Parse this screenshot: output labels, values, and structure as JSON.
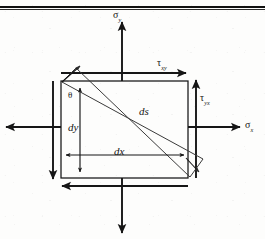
{
  "figure": {
    "kind": "stress-element-diagram",
    "running_head": "",
    "colors": {
      "ink": "#161616",
      "rule": "#111111",
      "paper": "#fdfdfc",
      "diagonal": "#3a3a3a"
    },
    "element": {
      "left": 61,
      "top": 81,
      "right": 188,
      "bottom": 178
    }
  },
  "labels": {
    "sigma_y_top": {
      "base": "σ",
      "sub": "y",
      "x": 113,
      "y": 10
    },
    "sigma_x_right": {
      "base": "σ",
      "sub": "x",
      "x": 245,
      "y": 120
    },
    "tau_xy_top": {
      "base": "τ",
      "sub": "xy",
      "x": 157,
      "y": 58
    },
    "tau_yx_right": {
      "base": "τ",
      "sub": "yx",
      "x": 200,
      "y": 93
    },
    "ds": {
      "text": "ds",
      "x": 139,
      "y": 106
    },
    "dy": {
      "text": "dy",
      "x": 68,
      "y": 122
    },
    "dx": {
      "text": "dx",
      "x": 114,
      "y": 146
    },
    "theta": {
      "text": "θ",
      "x": 68,
      "y": 91
    }
  },
  "arrows": {
    "sigma_y_up": {
      "name": "sigma-y-tension-up",
      "direction": "up"
    },
    "sigma_y_down": {
      "name": "sigma-y-tension-down",
      "direction": "down"
    },
    "sigma_x_left": {
      "name": "sigma-x-tension-left",
      "direction": "left"
    },
    "sigma_x_right": {
      "name": "sigma-x-tension-right",
      "direction": "right"
    },
    "tau_top": {
      "name": "tau-xy-shear-top",
      "direction": "right"
    },
    "tau_bottom": {
      "name": "tau-xy-shear-bottom",
      "direction": "left"
    },
    "tau_right": {
      "name": "tau-yx-shear-right",
      "direction": "up"
    },
    "tau_left": {
      "name": "tau-yx-shear-left",
      "direction": "down"
    },
    "ds_upper": {
      "name": "ds-plane-arrow-upper",
      "direction": "up-left"
    },
    "ds_lower": {
      "name": "ds-plane-arrow-lower",
      "direction": "down-right"
    }
  },
  "dimensions": {
    "dy": {
      "name": "dy-dimension",
      "orientation": "vertical"
    },
    "dx": {
      "name": "dx-dimension",
      "orientation": "horizontal"
    }
  }
}
